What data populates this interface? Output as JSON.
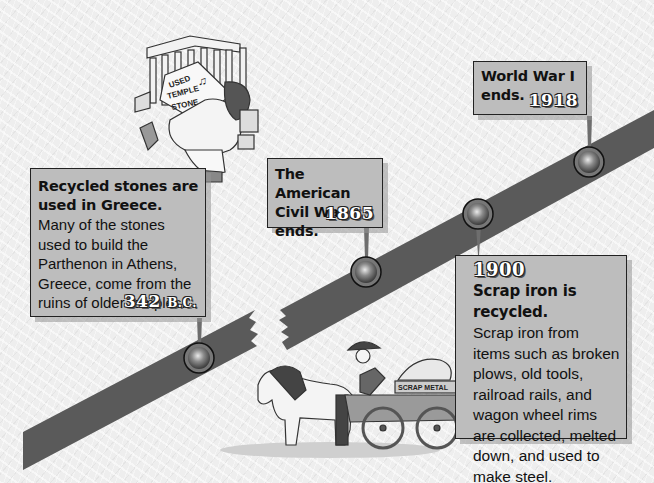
{
  "timeline": {
    "events": [
      {
        "year": "342",
        "era": "B.C.",
        "headline": "Recycled stones are used in Greece.",
        "description": "Many of the stones used to build the Parthenon in Athens, Greece, come from the ruins of older temples."
      },
      {
        "year": "1865",
        "headline": "The American Civil War ends."
      },
      {
        "year": "1900",
        "headline": "Scrap iron is recycled.",
        "description": "Scrap iron from items such as broken plows, old tools, railroad rails, and wagon wheel rims are collected, melted down, and used to make steel."
      },
      {
        "year": "1918",
        "headline": "World War I ends."
      }
    ],
    "colors": {
      "band": "#5a5a5a",
      "box": "#bdbdbd",
      "pin": "#6e6e6e"
    }
  },
  "illustrations": {
    "greek": {
      "sign_lines": [
        "USED",
        "TEMPLE",
        "STONE"
      ],
      "notes": "♫"
    },
    "wagon": {
      "sign": "SCRAP METAL"
    }
  }
}
